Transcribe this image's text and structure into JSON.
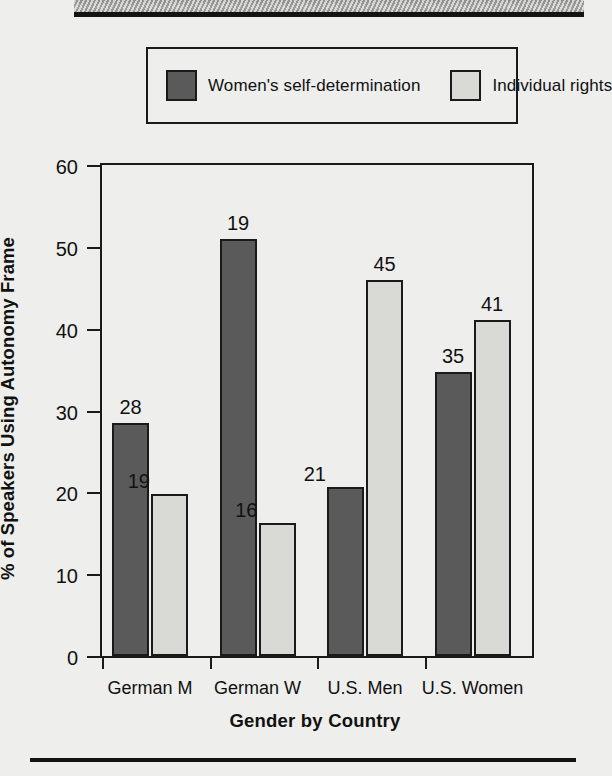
{
  "chart_data": {
    "type": "bar",
    "title": "",
    "xlabel": "Gender by Country",
    "ylabel": "% of Speakers Using Autonomy Frame",
    "categories": [
      "German M",
      "German W",
      "U.S. Men",
      "U.S. Women"
    ],
    "ylim": [
      0,
      60
    ],
    "yticks": [
      0,
      10,
      20,
      30,
      40,
      50,
      60
    ],
    "ytick_labels": [
      "0",
      "10",
      "20",
      "30",
      "40",
      "50",
      "60"
    ],
    "grid": false,
    "legend_position": "top",
    "series": [
      {
        "name": "Women's self-determination",
        "color": "#5a5a5a",
        "values": [
          28.5,
          51.0,
          20.7,
          34.7
        ],
        "point_labels": [
          "28",
          "19",
          "21",
          "35"
        ]
      },
      {
        "name": "Individual rights",
        "color": "#d9d9d6",
        "values": [
          19.8,
          16.3,
          46.0,
          41.0
        ],
        "point_labels": [
          "19",
          "16",
          "45",
          "41"
        ]
      }
    ],
    "annotations": "Numbers above each bar are the sample size (n) of speakers in that group."
  },
  "legend": {
    "entries": [
      {
        "label": "Women's self-determination",
        "color": "#5a5a5a"
      },
      {
        "label": "Individual rights",
        "color": "#d9d9d6"
      }
    ]
  },
  "axes": {
    "y_title": "% of Speakers Using Autonomy Frame",
    "x_title": "Gender by Country"
  },
  "colors": {
    "series_dark": "#5a5a5a",
    "series_light": "#d9d9d6",
    "ink": "#1a1a1a",
    "page": "#eeeeec"
  }
}
